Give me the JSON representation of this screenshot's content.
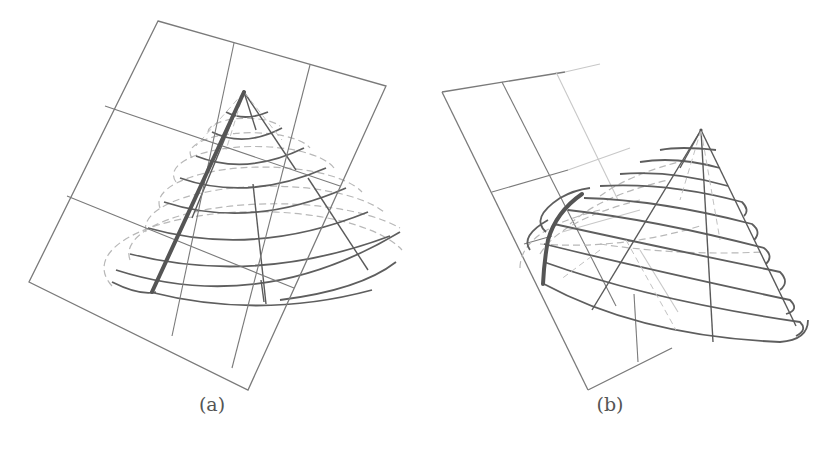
{
  "figure": {
    "panels": [
      {
        "id": "a",
        "caption": "(a)",
        "description": "Cone intersected by a tilted plane with a 3x3 grid; a thick straight line along a cone generator from apex to base",
        "highlight": "straight generator line"
      },
      {
        "id": "b",
        "caption": "(b)",
        "description": "Cone tilted relative to a plane with grid; a thick curved line on the cone surface where it meets the plane",
        "highlight": "curved intersection arc"
      }
    ],
    "colors": {
      "line": "#5e5e5e",
      "thick_line": "#555555",
      "hidden_line": "#b8b8b8",
      "background": "#ffffff"
    }
  }
}
